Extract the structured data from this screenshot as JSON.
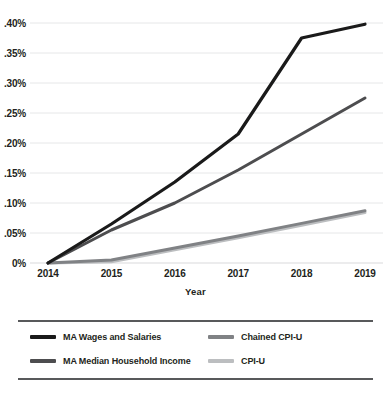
{
  "chart_data": {
    "type": "line",
    "title": "",
    "xlabel": "Year",
    "ylabel": "",
    "x": [
      2014,
      2015,
      2016,
      2017,
      2018,
      2019
    ],
    "categories": [
      "2014",
      "2015",
      "2016",
      "2017",
      "2018",
      "2019"
    ],
    "xtick_labels": [
      "2014",
      "2015",
      "2016",
      "2017",
      "2018",
      "2019"
    ],
    "ytick_labels": [
      "0%",
      ".05%",
      ".10%",
      ".15%",
      ".20%",
      ".25%",
      ".30%",
      ".35%",
      ".40%"
    ],
    "ytick_values": [
      0,
      0.05,
      0.1,
      0.15,
      0.2,
      0.25,
      0.3,
      0.35,
      0.4
    ],
    "ylim": [
      0,
      0.4
    ],
    "grid": "horizontal",
    "legend_position": "bottom",
    "series": [
      {
        "name": "MA Wages and Salaries",
        "color": "#1a1a1a",
        "values": [
          0,
          0.065,
          0.135,
          0.215,
          0.375,
          0.398
        ]
      },
      {
        "name": "MA Median Household Income",
        "color": "#4d4d4f",
        "values": [
          0,
          0.055,
          0.1,
          0.155,
          0.215,
          0.275
        ]
      },
      {
        "name": "Chained CPI-U",
        "color": "#808285",
        "values": [
          0,
          0.005,
          0.025,
          0.045,
          0.066,
          0.087
        ]
      },
      {
        "name": "CPI-U",
        "color": "#bcbec0",
        "values": [
          0,
          0.002,
          0.022,
          0.042,
          0.063,
          0.084
        ]
      }
    ]
  },
  "axis": {
    "x_title": "Year"
  },
  "legend": {
    "items": [
      {
        "label": "MA Wages and Salaries",
        "color": "#1a1a1a"
      },
      {
        "label": "MA Median Household Income",
        "color": "#4d4d4f"
      },
      {
        "label": "Chained CPI-U",
        "color": "#808285"
      },
      {
        "label": "CPI-U",
        "color": "#bcbec0"
      }
    ]
  },
  "style": {
    "gridline_color": "#e6e7e8",
    "axis_color": "#d9dadb",
    "text_color": "#231f20",
    "background": "#ffffff"
  }
}
